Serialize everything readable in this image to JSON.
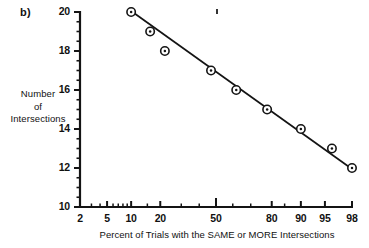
{
  "figure": {
    "panel_label": "b)",
    "ylabel_lines": [
      "Number",
      "of",
      "Intersections"
    ],
    "xlabel": "Percent of Trials with the SAME or MORE Intersections",
    "marker_name": "circled-dot-marker",
    "ink_color": "#141414",
    "background_color": "#ffffff"
  },
  "chart_data": {
    "type": "scatter",
    "title": "",
    "subtitle": "",
    "panel": "b)",
    "xlabel": "Percent of Trials with the SAME or MORE Intersections",
    "ylabel": "Number of Intersections",
    "x_scale": "probability",
    "xlim": [
      2,
      98
    ],
    "ylim": [
      10,
      20
    ],
    "grid": false,
    "legend": null,
    "x_tick_labels": [
      "2",
      "5",
      "10",
      "20",
      "50",
      "80",
      "90",
      "95",
      "98"
    ],
    "x_ticks": [
      2,
      5,
      10,
      20,
      50,
      80,
      90,
      95,
      98
    ],
    "y_tick_labels": [
      "10",
      "12",
      "14",
      "16",
      "18",
      "20"
    ],
    "y_ticks": [
      10,
      12,
      14,
      16,
      18,
      20
    ],
    "y_minor_tick_step": 0.5,
    "series": [
      {
        "name": "Intersections vs percent of trials",
        "marker": "circled-dot",
        "x": [
          10,
          16,
          22,
          47,
          62,
          78,
          90,
          96,
          98
        ],
        "y": [
          20,
          19,
          18,
          17,
          16,
          15,
          14,
          13,
          12
        ]
      }
    ],
    "fit_line": {
      "type": "line",
      "x": [
        10,
        98
      ],
      "y": [
        20.05,
        11.95
      ]
    }
  },
  "stray_marks": {
    "top_tick_artifact": "scan-artifact"
  }
}
